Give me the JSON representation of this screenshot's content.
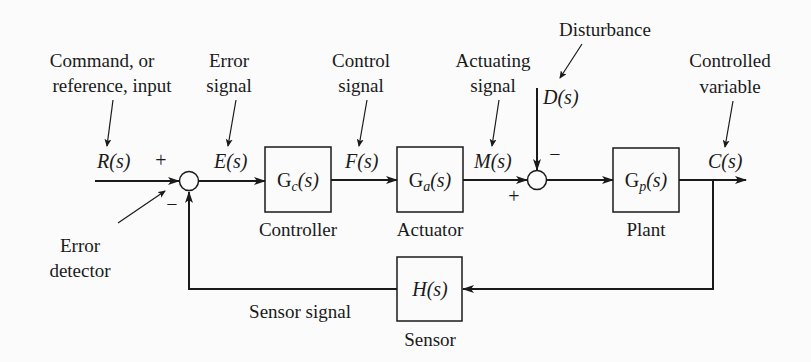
{
  "diagram": {
    "type": "feedback-control-block-diagram",
    "annotations": {
      "command_line1": "Command, or",
      "command_line2": "reference, input",
      "error_signal_line1": "Error",
      "error_signal_line2": "signal",
      "control_signal_line1": "Control",
      "control_signal_line2": "signal",
      "actuating_signal_line1": "Actuating",
      "actuating_signal_line2": "signal",
      "disturbance": "Disturbance",
      "controlled_variable_line1": "Controlled",
      "controlled_variable_line2": "variable",
      "error_detector_line1": "Error",
      "error_detector_line2": "detector",
      "sensor_signal": "Sensor signal"
    },
    "signals": {
      "input": "R(s)",
      "error": "E(s)",
      "control": "F(s)",
      "actuating": "M(s)",
      "disturbance": "D(s)",
      "output": "C(s)"
    },
    "blocks": [
      {
        "id": "controller",
        "tf_main": "G",
        "tf_sub": "c",
        "tf_arg": "(s)",
        "label": "Controller"
      },
      {
        "id": "actuator",
        "tf_main": "G",
        "tf_sub": "a",
        "tf_arg": "(s)",
        "label": "Actuator"
      },
      {
        "id": "plant",
        "tf_main": "G",
        "tf_sub": "p",
        "tf_arg": "(s)",
        "label": "Plant"
      },
      {
        "id": "sensor",
        "tf_main": "H",
        "tf_sub": "",
        "tf_arg": "(s)",
        "label": "Sensor"
      }
    ],
    "junctions": [
      {
        "id": "error-detector",
        "signs": {
          "input": "+",
          "feedback": "−"
        }
      },
      {
        "id": "disturbance-summer",
        "signs": {
          "actuating": "+",
          "disturbance": "−"
        }
      }
    ]
  }
}
